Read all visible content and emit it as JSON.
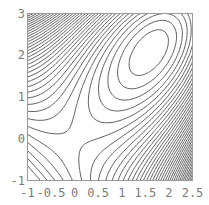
{
  "chart_data": {
    "type": "contour",
    "title": "",
    "xlabel": "",
    "ylabel": "",
    "xlim": [
      -1,
      2.5
    ],
    "ylim": [
      -1,
      3
    ],
    "x_ticks": [
      -1,
      -0.5,
      0,
      0.5,
      1,
      1.5,
      2,
      2.5
    ],
    "x_tick_labels": [
      "-1",
      "-0.5",
      "0",
      "0.5",
      "1",
      "1.5",
      "2",
      "2.5"
    ],
    "y_ticks": [
      -1,
      0,
      1,
      2,
      3
    ],
    "y_tick_labels": [
      "-1",
      "0",
      "1",
      "2",
      "3"
    ],
    "grid": false,
    "legend": null,
    "features": {
      "local_maximum": {
        "x": 1.6,
        "y": 2.1
      },
      "saddle_point": {
        "x": 0.0,
        "y": 0.0
      },
      "dense_regions": [
        "upper-left corner near (-1, 3)",
        "lower-right corner near (2.5, -1)"
      ]
    },
    "approx_function": {
      "form": "k*x*y - x^3/a - y^3/b",
      "k": 1.0,
      "a": 3.657,
      "b": 8.27
    },
    "contour_levels": {
      "min": -6.8,
      "max": 1.05,
      "count": 40
    },
    "line_color": "#606060",
    "frame_color": "#9a9a9a"
  }
}
